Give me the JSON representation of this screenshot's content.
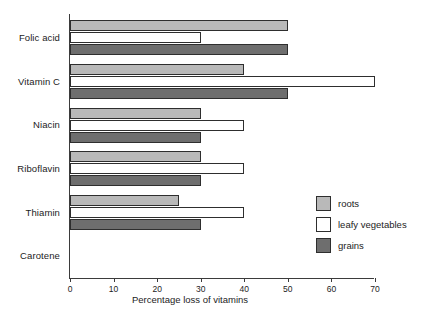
{
  "chart_data": {
    "type": "bar",
    "orientation": "horizontal",
    "title": "",
    "xlabel": "Percentage loss of vitamins",
    "ylabel": "",
    "xlim": [
      0,
      70
    ],
    "xticks": [
      0,
      10,
      20,
      30,
      40,
      50,
      60,
      70
    ],
    "xtick_labels": [
      "0",
      "10",
      "20",
      "30",
      "40",
      "50",
      "60",
      "70"
    ],
    "grid": false,
    "legend_position": "right-middle",
    "categories": [
      "Folic acid",
      "Vitamin C",
      "Niacin",
      "Riboflavin",
      "Thiamin",
      "Carotene"
    ],
    "series": [
      {
        "name": "roots",
        "color": "#b9b9b9",
        "values": [
          50,
          40,
          30,
          30,
          25,
          0
        ]
      },
      {
        "name": "leafy vegetables",
        "color": "#ffffff",
        "values": [
          30,
          70,
          40,
          40,
          40,
          0
        ]
      },
      {
        "name": "grains",
        "color": "#6e6e6e",
        "values": [
          50,
          50,
          30,
          30,
          30,
          0
        ]
      }
    ]
  },
  "axis": {
    "x_title": "Percentage loss of vitamins"
  },
  "legend": {
    "items": [
      {
        "label": "roots",
        "color": "#b9b9b9"
      },
      {
        "label": "leafy vegetables",
        "color": "#ffffff"
      },
      {
        "label": "grains",
        "color": "#6e6e6e"
      }
    ]
  }
}
